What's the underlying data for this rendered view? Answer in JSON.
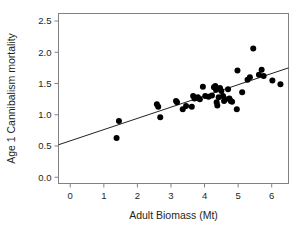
{
  "chart_data": {
    "type": "scatter",
    "title": "",
    "xlabel": "Adult Biomass (Mt)",
    "ylabel": "Age 1 Cannibalism mortality",
    "xlim": [
      -0.35,
      6.5
    ],
    "ylim": [
      -0.1,
      2.62
    ],
    "xticks": [
      0,
      1,
      2,
      3,
      4,
      5,
      6
    ],
    "xtick_labels": [
      "0",
      "1",
      "2",
      "3",
      "4",
      "5",
      "6"
    ],
    "yticks": [
      0.0,
      0.5,
      1.0,
      1.5,
      2.0,
      2.5
    ],
    "ytick_labels": [
      "0.0",
      "0.5",
      "1.0",
      "1.5",
      "2.0",
      "2.5"
    ],
    "grid": false,
    "legend": false,
    "marker_color": "#000000",
    "marker_size": 3.0,
    "line_color": "#231f20",
    "axis_color": "#808285",
    "fit_line": {
      "name": "linear regression",
      "x": [
        -0.35,
        6.5
      ],
      "y": [
        0.52,
        1.75
      ],
      "slope": 0.18,
      "intercept": 0.583
    },
    "points": [
      {
        "x": 1.38,
        "y": 0.63
      },
      {
        "x": 1.45,
        "y": 0.9
      },
      {
        "x": 2.58,
        "y": 1.17
      },
      {
        "x": 2.62,
        "y": 1.13
      },
      {
        "x": 2.68,
        "y": 0.96
      },
      {
        "x": 3.15,
        "y": 1.22
      },
      {
        "x": 3.18,
        "y": 1.2
      },
      {
        "x": 3.35,
        "y": 1.09
      },
      {
        "x": 3.45,
        "y": 1.14
      },
      {
        "x": 3.62,
        "y": 1.13
      },
      {
        "x": 3.66,
        "y": 1.3
      },
      {
        "x": 3.7,
        "y": 1.26
      },
      {
        "x": 3.74,
        "y": 1.27
      },
      {
        "x": 3.8,
        "y": 1.28
      },
      {
        "x": 3.86,
        "y": 1.25
      },
      {
        "x": 3.95,
        "y": 1.45
      },
      {
        "x": 4.02,
        "y": 1.3
      },
      {
        "x": 4.12,
        "y": 1.29
      },
      {
        "x": 4.22,
        "y": 1.31
      },
      {
        "x": 4.28,
        "y": 1.44
      },
      {
        "x": 4.32,
        "y": 1.46
      },
      {
        "x": 4.34,
        "y": 1.4
      },
      {
        "x": 4.36,
        "y": 1.2
      },
      {
        "x": 4.38,
        "y": 1.15
      },
      {
        "x": 4.42,
        "y": 1.28
      },
      {
        "x": 4.46,
        "y": 1.43
      },
      {
        "x": 4.5,
        "y": 1.38
      },
      {
        "x": 4.55,
        "y": 1.3
      },
      {
        "x": 4.58,
        "y": 1.22
      },
      {
        "x": 4.62,
        "y": 1.25
      },
      {
        "x": 4.7,
        "y": 1.41
      },
      {
        "x": 4.74,
        "y": 1.26
      },
      {
        "x": 4.78,
        "y": 1.22
      },
      {
        "x": 4.82,
        "y": 1.21
      },
      {
        "x": 4.96,
        "y": 1.09
      },
      {
        "x": 4.98,
        "y": 1.71
      },
      {
        "x": 5.12,
        "y": 1.36
      },
      {
        "x": 5.28,
        "y": 1.56
      },
      {
        "x": 5.35,
        "y": 1.6
      },
      {
        "x": 5.45,
        "y": 2.06
      },
      {
        "x": 5.62,
        "y": 1.64
      },
      {
        "x": 5.7,
        "y": 1.72
      },
      {
        "x": 5.76,
        "y": 1.62
      },
      {
        "x": 6.02,
        "y": 1.55
      },
      {
        "x": 6.26,
        "y": 1.49
      }
    ]
  }
}
